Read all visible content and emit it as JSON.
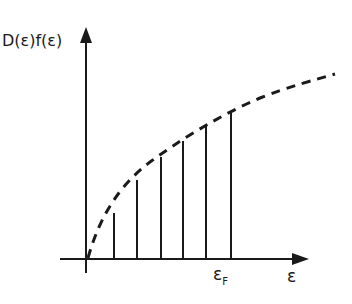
{
  "diagram": {
    "y_axis_label": "D(ε)f(ε)",
    "x_axis_label": "ε",
    "fermi_label_main": "ε",
    "fermi_label_sub": "F",
    "colors": {
      "line": "#1a1a1a",
      "background": "#ffffff"
    },
    "bars": [
      {
        "x": 114,
        "top": 213
      },
      {
        "x": 137,
        "top": 180
      },
      {
        "x": 161,
        "top": 157
      },
      {
        "x": 183,
        "top": 141
      },
      {
        "x": 206,
        "top": 125
      },
      {
        "x": 231,
        "top": 111
      }
    ]
  }
}
